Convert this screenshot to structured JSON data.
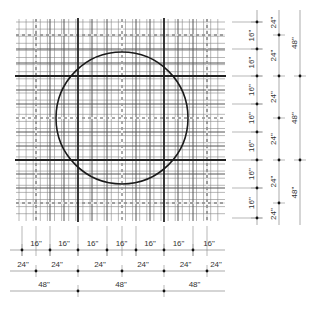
{
  "diagram": {
    "colors": {
      "background": "#ffffff",
      "heavy_line": "#222222",
      "grid_line": "#555555",
      "fine_line": "#888888",
      "dashed_line": "#555555",
      "circle": "#1a1a1a",
      "dim_line": "#888888",
      "dot": "#111111"
    },
    "grid": {
      "left": 19,
      "top": 22,
      "right": 222,
      "bottom": 218,
      "fine_step": 7.1,
      "heavy_x": [
        78,
        164
      ],
      "heavy_y": [
        76,
        160
      ],
      "medium_x": [
        36,
        50,
        64,
        92,
        107,
        136,
        150,
        178,
        193,
        207
      ],
      "medium_y": [
        35,
        49,
        63,
        90,
        104,
        132,
        146,
        174,
        188,
        203
      ],
      "dashed_x": [
        36,
        122,
        207
      ],
      "dashed_y": [
        35,
        118,
        203
      ]
    },
    "circle": {
      "cx": 122,
      "cy": 118,
      "r": 66
    },
    "right_dimensions": {
      "columns": [
        {
          "x": 257,
          "label": "16\"",
          "ticks": [
            22,
            49,
            76,
            104,
            132,
            160,
            188,
            218
          ],
          "segments": [
            "16\"",
            "16\"",
            "16\"",
            "16\"",
            "16\"",
            "16\""
          ]
        },
        {
          "x": 279,
          "label": "24\"",
          "ticks": [
            35,
            76,
            118,
            160,
            203
          ],
          "segments": [
            "24\"",
            "24\"",
            "24\"",
            "24\""
          ]
        },
        {
          "x": 300,
          "label": "48\"",
          "ticks": [
            76,
            160
          ],
          "segments": [
            "48\"",
            "48\"",
            "48\""
          ]
        }
      ]
    },
    "bottom_dimensions": {
      "rows": [
        {
          "y": 250,
          "ticks": [
            22,
            50,
            78,
            107,
            136,
            164,
            193
          ],
          "segments": [
            "16\"",
            "16\"",
            "16\"",
            "16\"",
            "16\"",
            "16\"",
            "16\""
          ]
        },
        {
          "y": 271,
          "ticks": [
            36,
            78,
            122,
            164,
            207
          ],
          "segments": [
            "24\"",
            "24\"",
            "24\"",
            "24\""
          ]
        },
        {
          "y": 291,
          "ticks": [
            78,
            164
          ],
          "segments": [
            "48\"",
            "48\"",
            "48\""
          ]
        }
      ]
    }
  }
}
